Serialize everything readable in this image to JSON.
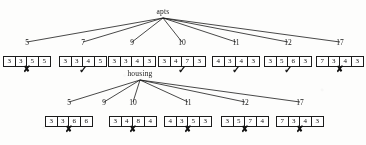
{
  "diagram": {
    "type": "tree",
    "roots": [
      {
        "id": "apts",
        "label": "apts",
        "x": 163,
        "y": 12,
        "child_ids": [
          "r1-5",
          "r1-7",
          "r1-9",
          "r1-10",
          "r1-11",
          "r1-12",
          "r1-17"
        ]
      },
      {
        "id": "housing",
        "label": "housing",
        "x": 140,
        "y": 74,
        "child_ids": [
          "r2-5",
          "r2-9",
          "r2-10",
          "r2-11",
          "r2-12",
          "r2-17"
        ]
      }
    ],
    "nodes": [
      {
        "id": "r1-5",
        "number": "5",
        "x": 27,
        "label_y": 44,
        "box_y": 56,
        "values": [
          "3",
          "3",
          "5",
          "5"
        ],
        "mark": "✘",
        "mark_kind": "cross",
        "mark_y": 70
      },
      {
        "id": "r1-7",
        "number": "7",
        "x": 83,
        "label_y": 44,
        "box_y": 56,
        "values": [
          "3",
          "3",
          "4",
          "5"
        ],
        "mark": "✓",
        "mark_kind": "check",
        "mark_y": 70
      },
      {
        "id": "r1-9",
        "number": "9",
        "x": 132,
        "label_y": 44,
        "box_y": 56,
        "values": [
          "3",
          "3",
          "4",
          "3"
        ],
        "mark": "",
        "mark_kind": "none",
        "mark_y": 70
      },
      {
        "id": "r1-10",
        "number": "10",
        "x": 182,
        "label_y": 44,
        "box_y": 56,
        "values": [
          "3",
          "4",
          "7",
          "3"
        ],
        "mark": "✓",
        "mark_kind": "check",
        "mark_y": 70
      },
      {
        "id": "r1-11",
        "number": "11",
        "x": 236,
        "label_y": 44,
        "box_y": 56,
        "values": [
          "4",
          "3",
          "4",
          "3"
        ],
        "mark": "✓",
        "mark_kind": "check",
        "mark_y": 70
      },
      {
        "id": "r1-12",
        "number": "12",
        "x": 288,
        "label_y": 44,
        "box_y": 56,
        "values": [
          "3",
          "5",
          "6",
          "3"
        ],
        "mark": "✓",
        "mark_kind": "check",
        "mark_y": 70
      },
      {
        "id": "r1-17",
        "number": "17",
        "x": 340,
        "label_y": 44,
        "box_y": 56,
        "values": [
          "7",
          "3",
          "4",
          "3"
        ],
        "mark": "✘",
        "mark_kind": "cross",
        "mark_y": 70
      },
      {
        "id": "r2-5",
        "number": "5",
        "x": 69,
        "label_y": 104,
        "box_y": 116,
        "values": [
          "3",
          "3",
          "6",
          "6"
        ],
        "mark": "✘",
        "mark_kind": "cross",
        "mark_y": 130
      },
      {
        "id": "r2-9",
        "number": "9",
        "x": 104,
        "label_y": 104,
        "box_y": null,
        "values": [],
        "mark": "",
        "mark_kind": "none",
        "mark_y": null
      },
      {
        "id": "r2-10",
        "number": "10",
        "x": 133,
        "label_y": 104,
        "box_y": 116,
        "values": [
          "3",
          "4",
          "8",
          "4"
        ],
        "mark": "✘",
        "mark_kind": "cross",
        "mark_y": 130
      },
      {
        "id": "r2-11",
        "number": "11",
        "x": 188,
        "label_y": 104,
        "box_y": 116,
        "values": [
          "4",
          "3",
          "5",
          "3"
        ],
        "mark": "✘",
        "mark_kind": "cross",
        "mark_y": 130
      },
      {
        "id": "r2-12",
        "number": "12",
        "x": 245,
        "label_y": 104,
        "box_y": 116,
        "values": [
          "3",
          "5",
          "7",
          "4"
        ],
        "mark": "✘",
        "mark_kind": "cross",
        "mark_y": 130
      },
      {
        "id": "r2-17",
        "number": "17",
        "x": 300,
        "label_y": 104,
        "box_y": 116,
        "values": [
          "7",
          "3",
          "4",
          "3"
        ],
        "mark": "✘",
        "mark_kind": "cross",
        "mark_y": 130
      }
    ],
    "style": {
      "ink_color": "#1a1a1a",
      "paper_color": "#fdfdfc",
      "box_border_color": "#1c1c1c",
      "cell_width": 12,
      "cell_count": 4
    }
  }
}
